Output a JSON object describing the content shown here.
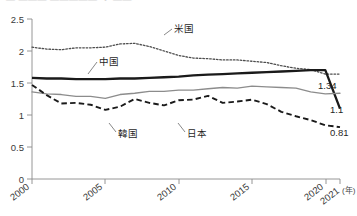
{
  "header": {
    "clipped_title": "― ―――  ――――― ・ ――",
    "note": "top line of source image is cut off and illegible"
  },
  "axes": {
    "y_ticks": [
      "0",
      "0.5",
      "1",
      "1.5",
      "2",
      "2.5"
    ],
    "x_ticks": [
      "2000",
      "2005",
      "2010",
      "2015",
      "2020",
      "2021"
    ],
    "x_unit": "(年)"
  },
  "series_labels": {
    "us": "米国",
    "china": "中国",
    "korea": "韓国",
    "japan": "日本"
  },
  "end_labels": {
    "japan_value": "1.34",
    "china_value": "1.1",
    "korea_value": "0.81"
  },
  "colors": {
    "us_line": "#4d4d4d",
    "china_line": "#1a1a1a",
    "japan_line": "#8c8c8c",
    "korea_line": "#1a1a1a",
    "axis": "#8a8a8a",
    "text": "#2b2b2b",
    "background": "#ffffff"
  },
  "chart_data": {
    "type": "line",
    "title": "",
    "xlabel": "(年)",
    "ylabel": "",
    "xlim": [
      2000,
      2021
    ],
    "ylim": [
      0,
      2.5
    ],
    "grid": false,
    "legend": "inline-annotations",
    "x": [
      2000,
      2001,
      2002,
      2003,
      2004,
      2005,
      2006,
      2007,
      2008,
      2009,
      2010,
      2011,
      2012,
      2013,
      2014,
      2015,
      2016,
      2017,
      2018,
      2019,
      2020,
      2021
    ],
    "series": [
      {
        "name": "米国",
        "style": "dotted",
        "color": "#4d4d4d",
        "values": [
          2.06,
          2.03,
          2.02,
          2.05,
          2.05,
          2.06,
          2.11,
          2.12,
          2.07,
          2.0,
          1.93,
          1.89,
          1.88,
          1.86,
          1.86,
          1.84,
          1.82,
          1.77,
          1.73,
          1.71,
          1.64,
          1.64
        ],
        "end_label": null
      },
      {
        "name": "中国",
        "style": "solid-thick",
        "color": "#1a1a1a",
        "values": [
          1.58,
          1.57,
          1.57,
          1.56,
          1.56,
          1.56,
          1.57,
          1.57,
          1.58,
          1.59,
          1.6,
          1.62,
          1.63,
          1.64,
          1.65,
          1.66,
          1.67,
          1.68,
          1.69,
          1.7,
          1.7,
          1.1
        ],
        "end_label": "1.1"
      },
      {
        "name": "日本",
        "style": "solid-thin",
        "color": "#8c8c8c",
        "values": [
          1.36,
          1.33,
          1.32,
          1.29,
          1.29,
          1.26,
          1.32,
          1.34,
          1.37,
          1.37,
          1.39,
          1.39,
          1.41,
          1.43,
          1.42,
          1.45,
          1.44,
          1.43,
          1.42,
          1.36,
          1.33,
          1.34
        ],
        "end_label": "1.34"
      },
      {
        "name": "韓国",
        "style": "dashed",
        "color": "#1a1a1a",
        "values": [
          1.47,
          1.31,
          1.18,
          1.19,
          1.16,
          1.08,
          1.13,
          1.25,
          1.19,
          1.15,
          1.23,
          1.24,
          1.3,
          1.19,
          1.21,
          1.24,
          1.17,
          1.05,
          0.98,
          0.92,
          0.84,
          0.81
        ],
        "end_label": "0.81"
      }
    ],
    "annotations": [
      {
        "text": "米国",
        "x": 2012.6,
        "y": 2.28
      },
      {
        "text": "中国",
        "x": 2006.5,
        "y": 1.82
      },
      {
        "text": "韓国",
        "x": 2008.3,
        "y": 0.88
      },
      {
        "text": "日本",
        "x": 2014.2,
        "y": 0.88
      }
    ]
  }
}
